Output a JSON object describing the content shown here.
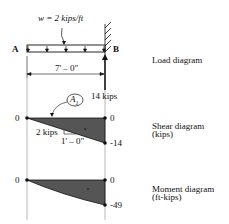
{
  "load": {
    "w_label": "w  =  2 kips/ft",
    "end_a": "A",
    "end_b": "B",
    "span": "7' – 0\"",
    "reaction": "14 kips"
  },
  "shear": {
    "left_value": "0",
    "right_top_value": "0",
    "right_bottom_value": "-14",
    "slope_rise": "2 kips",
    "slope_run": "1' – 0\"",
    "area_label": "A",
    "area_subscript": "1"
  },
  "moment": {
    "left_value": "0",
    "right_top_value": "0",
    "right_bottom_value": "-49"
  },
  "labels": {
    "load_diagram": "Load diagram",
    "shear_diagram_1": "Shear diagram",
    "shear_diagram_2": "(kips)",
    "moment_diagram_1": "Moment diagram",
    "moment_diagram_2": "(ft-kips)"
  },
  "colors": {
    "fill": "#555555",
    "line": "#111111"
  }
}
